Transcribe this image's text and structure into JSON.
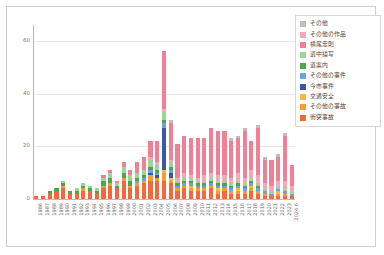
{
  "chart_data": {
    "type": "bar",
    "stacked": true,
    "title": "",
    "subtitle": "",
    "xlabel": "",
    "ylabel": "",
    "ylim": [
      0,
      66
    ],
    "yticks": [
      0,
      20,
      40,
      60
    ],
    "ytick_labels": [
      "0",
      "20",
      "40",
      "60"
    ],
    "grid": true,
    "legend_position": "top-right",
    "categories": [
      "1986",
      "1987",
      "1988",
      "1989",
      "1990",
      "1991",
      "1992",
      "1993",
      "1994",
      "1995",
      "1996",
      "1997",
      "1998",
      "1999",
      "2000",
      "2001",
      "2002",
      "2003",
      "2004",
      "2005",
      "2006",
      "2007",
      "2008",
      "2009",
      "2010",
      "2011",
      "2012",
      "2013",
      "2014",
      "2015",
      "2016",
      "2017",
      "2018",
      "2019",
      "2020",
      "2021",
      "2022",
      "2023",
      "2024.6"
    ],
    "series": [
      {
        "name": "衝突事故",
        "color": "#f4693c",
        "values": [
          1,
          1,
          2,
          3,
          4,
          2,
          2,
          3,
          3,
          2,
          4,
          5,
          4,
          7,
          4,
          5,
          6,
          7,
          7,
          7,
          6,
          3,
          4,
          3,
          3,
          3,
          4,
          2,
          3,
          2,
          2,
          2,
          3,
          2,
          1,
          1,
          1,
          1,
          1
        ]
      },
      {
        "name": "その他の事故",
        "color": "#f99d32",
        "values": [
          0,
          0,
          0,
          0,
          1,
          0,
          0,
          1,
          0,
          0,
          1,
          1,
          0,
          1,
          1,
          1,
          1,
          2,
          1,
          3,
          1,
          1,
          1,
          1,
          1,
          1,
          1,
          1,
          1,
          1,
          1,
          1,
          1,
          1,
          1,
          0,
          1,
          1,
          0
        ]
      },
      {
        "name": "交通安全",
        "color": "#f6b93f",
        "values": [
          0,
          0,
          0,
          0,
          0,
          0,
          0,
          0,
          0,
          0,
          0,
          0,
          0,
          0,
          0,
          0,
          0,
          0,
          0,
          1,
          1,
          0,
          0,
          1,
          0,
          0,
          0,
          1,
          0,
          0,
          1,
          0,
          1,
          0,
          0,
          0,
          1,
          0,
          0
        ]
      },
      {
        "name": "今市事件",
        "color": "#3b57a8",
        "values": [
          0,
          0,
          0,
          0,
          0,
          0,
          0,
          0,
          0,
          0,
          0,
          0,
          0,
          0,
          0,
          0,
          0,
          1,
          1,
          16,
          2,
          0,
          0,
          0,
          0,
          0,
          0,
          0,
          0,
          0,
          0,
          0,
          0,
          0,
          0,
          0,
          0,
          0,
          0
        ]
      },
      {
        "name": "その他の事件",
        "color": "#6aa3dd",
        "values": [
          0,
          0,
          0,
          0,
          0,
          0,
          0,
          0,
          0,
          0,
          0,
          0,
          0,
          0,
          0,
          1,
          1,
          1,
          1,
          2,
          1,
          1,
          1,
          1,
          1,
          1,
          1,
          1,
          1,
          1,
          1,
          1,
          1,
          1,
          1,
          1,
          1,
          1,
          1
        ]
      },
      {
        "name": "道案内",
        "color": "#4da64d",
        "values": [
          0,
          0,
          1,
          1,
          1,
          1,
          1,
          1,
          1,
          1,
          2,
          2,
          1,
          2,
          2,
          1,
          1,
          1,
          1,
          1,
          1,
          1,
          1,
          1,
          1,
          1,
          1,
          1,
          1,
          1,
          1,
          1,
          1,
          1,
          0,
          0,
          0,
          0,
          0
        ]
      },
      {
        "name": "道中描写",
        "color": "#9ed49a",
        "values": [
          0,
          0,
          0,
          0,
          1,
          0,
          1,
          1,
          1,
          1,
          1,
          2,
          1,
          2,
          2,
          2,
          2,
          3,
          2,
          3,
          2,
          1,
          1,
          1,
          1,
          1,
          1,
          1,
          1,
          1,
          1,
          1,
          1,
          1,
          1,
          1,
          1,
          1,
          1
        ]
      },
      {
        "name": "横尾忠則",
        "color": "#e8748d",
        "values": [
          0,
          0,
          0,
          0,
          0,
          0,
          0,
          0,
          0,
          0,
          0,
          0,
          0,
          0,
          0,
          0,
          0,
          0,
          0,
          0,
          0,
          0,
          0,
          0,
          0,
          0,
          0,
          0,
          0,
          0,
          0,
          0,
          0,
          0,
          0,
          0,
          0,
          0,
          0
        ]
      },
      {
        "name": "その他の作品",
        "color": "#f4a8bb",
        "values": [
          0,
          0,
          0,
          0,
          0,
          0,
          0,
          0,
          0,
          0,
          0,
          0,
          0,
          0,
          0,
          0,
          0,
          1,
          1,
          1,
          1,
          1,
          2,
          1,
          1,
          2,
          2,
          2,
          2,
          2,
          3,
          2,
          3,
          3,
          2,
          2,
          2,
          3,
          2
        ]
      },
      {
        "name": "積載忠則",
        "color": "#ef8096",
        "values": [
          0,
          0,
          0,
          0,
          0,
          0,
          0,
          0,
          0,
          0,
          1,
          1,
          1,
          2,
          2,
          4,
          5,
          6,
          8,
          22,
          14,
          13,
          14,
          14,
          15,
          14,
          17,
          17,
          17,
          14,
          13,
          18,
          11,
          18,
          9,
          10,
          9,
          17,
          8
        ]
      },
      {
        "name": "その他",
        "color": "#bdbdbd",
        "values": [
          0,
          0,
          0,
          0,
          0,
          0,
          0,
          0,
          0,
          0,
          0,
          0,
          0,
          0,
          0,
          0,
          0,
          0,
          0,
          0,
          1,
          0,
          0,
          0,
          0,
          0,
          0,
          0,
          0,
          1,
          1,
          1,
          0,
          1,
          1,
          0,
          1,
          1,
          0
        ]
      }
    ],
    "legend_entries": [
      {
        "label": "その他",
        "color": "#bdbdbd"
      },
      {
        "label": "その他の作品",
        "color": "#f4a8bb"
      },
      {
        "label": "横尾忠則",
        "color": "#ef8096"
      },
      {
        "label": "道中描写",
        "color": "#9ed49a"
      },
      {
        "label": "道案内",
        "color": "#4da64d"
      },
      {
        "label": "その他の事件",
        "color": "#6aa3dd"
      },
      {
        "label": "今市事件",
        "color": "#3b57a8"
      },
      {
        "label": "交通安全",
        "color": "#f6b93f"
      },
      {
        "label": "その他の事故",
        "color": "#f99d32"
      },
      {
        "label": "衝突事故",
        "color": "#f4693c"
      }
    ]
  }
}
